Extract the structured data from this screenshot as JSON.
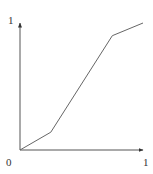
{
  "chart_data": {
    "type": "line",
    "title": "",
    "xlabel": "",
    "ylabel": "",
    "xlim": [
      0,
      1
    ],
    "ylim": [
      0,
      1
    ],
    "grid": false,
    "legend": null,
    "x_tick_labels": [
      "0",
      "1"
    ],
    "y_tick_labels": [
      "1"
    ],
    "series": [
      {
        "name": "curve",
        "x": [
          0,
          0.25,
          0.75,
          1.0
        ],
        "y": [
          0,
          0.14,
          0.9,
          1.0
        ],
        "color": "#666666"
      }
    ]
  },
  "labels": {
    "origin": "0",
    "x_max": "1",
    "y_max": "1"
  },
  "colors": {
    "axis": "#555555",
    "line": "#666666"
  }
}
